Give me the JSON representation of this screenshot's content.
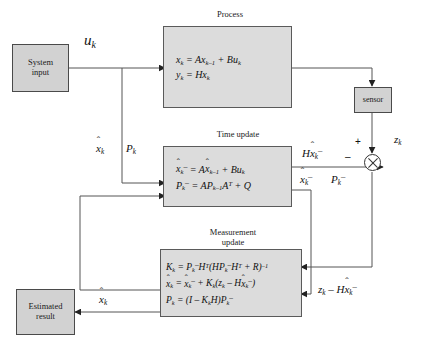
{
  "diagram": {
    "background": "#ffffff",
    "box_fill": "#d2d2d2",
    "eq_box_fill": "#dcdcdc",
    "line_color": "#555555"
  },
  "nodes": {
    "system_input": {
      "label_line1": "System",
      "label_line2": "input"
    },
    "sensor": {
      "label": "sensor"
    },
    "estimated_result": {
      "label_line1": "Estimated",
      "label_line2": "result"
    }
  },
  "blocks": {
    "process": {
      "caption": "Process",
      "eq1": {
        "lhs": "x",
        "lhs_sub": "k",
        "rhs": "= Ax",
        "rhs_sub": "k–1",
        "rhs2": "+ Bu",
        "rhs2_sub": "k"
      },
      "eq2": {
        "lhs": "y",
        "lhs_sub": "k",
        "rhs": "= Hx",
        "rhs_sub": "k"
      }
    },
    "time_update": {
      "caption": "Time update",
      "eq1_text": "x̂ₖ⁻ = Ax̂ₖ₋₁ + Buₖ",
      "eq2_text": "Pₖ⁻ = APₖ₋₁Aᵀ + Q"
    },
    "measurement_update": {
      "caption_line1": "Measurement",
      "caption_line2": "update",
      "eq1_text": "Kₖ = Pₖ⁻Hᵀ(HPₖ⁻Hᵀ + R)⁻¹",
      "eq2_text": "x̂ₖ = x̂ₖ⁻ + Kₖ(zₖ – Hx̂ₖ⁻)",
      "eq3_text": "Pₖ = (I – KₖH)Pₖ⁻"
    }
  },
  "signals": {
    "u_k": "u",
    "u_k_sub": "k",
    "x_hat_k": "x",
    "x_hat_k_sub": "k",
    "P_k": "P",
    "P_k_sub": "k",
    "x_hat_k_minus": "x",
    "x_hat_k_minus_sub": "k",
    "P_k_minus": "P",
    "P_k_minus_sub": "k",
    "H_x_hat_minus": "Hx",
    "H_x_hat_minus_sub": "k",
    "z_k": "z",
    "z_k_sub": "k",
    "residual": "zₖ – Hx̂ₖ⁻",
    "x_hat_out": "x",
    "x_hat_out_sub": "k",
    "plus_sign": "+",
    "minus_sign": "–"
  }
}
